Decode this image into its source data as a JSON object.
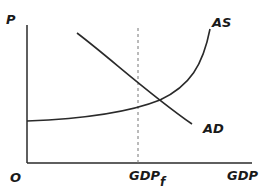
{
  "diagram": {
    "title": "",
    "axes": {
      "y_label": "P",
      "x_label": "GDP",
      "origin_label": "O"
    },
    "curves": [
      {
        "name": "AS",
        "label": "AS"
      },
      {
        "name": "AD",
        "label": "AD"
      }
    ],
    "markers": {
      "full_employment_label": "GDP",
      "full_employment_subscript": "f"
    },
    "colors": {
      "line": "#2a2a2a",
      "dashed": "#777777",
      "background": "#ffffff"
    }
  }
}
